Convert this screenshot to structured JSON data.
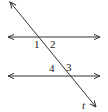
{
  "diagram": {
    "type": "parallel-lines-transversal",
    "stroke_color": "#333333",
    "lines": [
      {
        "name": "upper-parallel-line",
        "x1": 8,
        "y1": 37,
        "x2": 100,
        "y2": 37,
        "arrows": "both"
      },
      {
        "name": "lower-parallel-line",
        "x1": 8,
        "y1": 76,
        "x2": 100,
        "y2": 76,
        "arrows": "both"
      },
      {
        "name": "transversal-line",
        "x1": 10,
        "y1": 2,
        "x2": 96,
        "y2": 107,
        "arrows": "both"
      }
    ],
    "angle_labels": [
      {
        "id": "1",
        "text": "1",
        "x": 34,
        "y": 48
      },
      {
        "id": "2",
        "text": "2",
        "x": 50,
        "y": 48
      },
      {
        "id": "4",
        "text": "4",
        "x": 49,
        "y": 72
      },
      {
        "id": "3",
        "text": "3",
        "x": 66,
        "y": 71
      }
    ],
    "transversal_label": {
      "text": "t",
      "x": 82,
      "y": 109
    }
  }
}
